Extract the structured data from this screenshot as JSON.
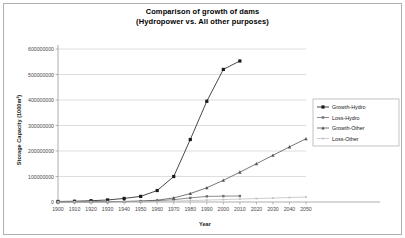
{
  "chart_data": {
    "type": "line",
    "title": "Comparison of growth of dams",
    "subtitle": "(Hydropower vs. All other purposes)",
    "xlabel": "Year",
    "ylabel": "Storage Capacity (1000m³)",
    "xlim": [
      1900,
      2050
    ],
    "ylim": [
      0,
      600000000
    ],
    "ytick_labels": [
      "0",
      "100000000",
      "200000000",
      "300000000",
      "400000000",
      "500000000",
      "600000000"
    ],
    "ytick_values": [
      0,
      100000000,
      200000000,
      300000000,
      400000000,
      500000000,
      600000000
    ],
    "xtick_labels": [
      "1900",
      "1910",
      "1920",
      "1930",
      "1940",
      "1950",
      "1960",
      "1970",
      "1980",
      "1990",
      "2000",
      "2010",
      "2020",
      "2030",
      "2040",
      "2050"
    ],
    "x": [
      1900,
      1910,
      1920,
      1930,
      1940,
      1950,
      1960,
      1970,
      1980,
      1990,
      2000,
      2010,
      2020,
      2030,
      2040,
      2050
    ],
    "grid": "horizontal",
    "legend_position": "right",
    "series": [
      {
        "name": "Growth-Hydro",
        "marker": "square",
        "color": "#1a1a1a",
        "values": [
          2000000,
          3000000,
          5000000,
          8000000,
          14000000,
          22000000,
          45000000,
          100000000,
          245000000,
          395000000,
          520000000,
          553000000,
          null,
          null,
          null,
          null
        ]
      },
      {
        "name": "Loss-Hydro",
        "marker": "square-small",
        "color": "#6e6e6e",
        "values": [
          500000,
          700000,
          900000,
          1200000,
          2000000,
          3000000,
          5000000,
          9000000,
          16000000,
          22000000,
          23000000,
          23500000,
          null,
          null,
          null,
          null
        ]
      },
      {
        "name": "Growth-Other",
        "marker": "triangle",
        "color": "#555555",
        "values": [
          300000,
          500000,
          800000,
          1200000,
          2000000,
          3500000,
          7000000,
          16000000,
          33000000,
          56000000,
          85000000,
          117000000,
          150000000,
          183000000,
          216000000,
          248000000
        ]
      },
      {
        "name": "Loss-Other",
        "marker": "dot",
        "color": "#c0c0c0",
        "values": [
          100000,
          150000,
          250000,
          400000,
          700000,
          1200000,
          2000000,
          3500000,
          5500000,
          7500000,
          9500000,
          11500000,
          13500000,
          15500000,
          17500000,
          19500000
        ]
      }
    ]
  }
}
